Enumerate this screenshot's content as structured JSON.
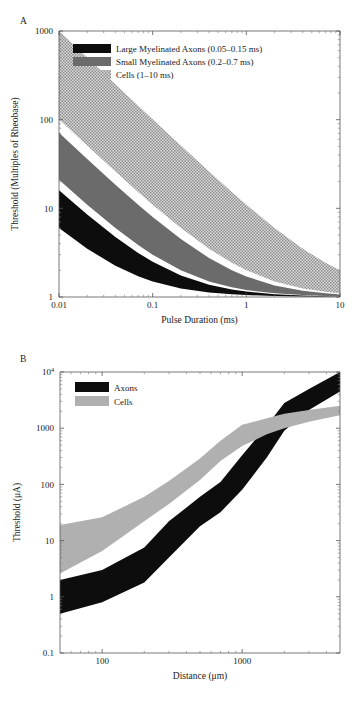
{
  "figure": {
    "panel_a_letter": "A",
    "panel_b_letter": "B"
  },
  "chart_data": [
    {
      "id": "panel-a",
      "type": "area",
      "title": "",
      "xlabel": "Pulse Duration (ms)",
      "ylabel": "Threshold (Multiples of Rheobase)",
      "xscale": "log",
      "yscale": "log",
      "xlim": [
        0.01,
        10
      ],
      "ylim": [
        1,
        1000
      ],
      "xticks": [
        0.01,
        0.1,
        1,
        10
      ],
      "xticklabels": [
        "0.01",
        "0.1",
        "1",
        "10"
      ],
      "yticks": [
        1,
        10,
        100,
        1000
      ],
      "yticklabels": [
        "1",
        "10",
        "100",
        "1000"
      ],
      "grid": false,
      "legend_position": "top-left",
      "series": [
        {
          "name": "Large Myelinated Axons (0.05–0.15 ms)",
          "swatch": "black",
          "color": "#0d0d0d",
          "chronaxie_ms": [
            0.05,
            0.15
          ],
          "x": [
            0.01,
            0.02,
            0.04,
            0.07,
            0.1,
            0.2,
            0.4,
            0.7,
            1.0,
            2.0,
            4.0,
            7.0,
            10.0
          ],
          "upper": [
            16.0,
            8.5,
            4.75,
            3.14,
            2.5,
            1.75,
            1.375,
            1.214,
            1.15,
            1.075,
            1.0375,
            1.0214,
            1.015
          ],
          "lower": [
            6.0,
            3.5,
            2.25,
            1.714,
            1.5,
            1.25,
            1.125,
            1.071,
            1.05,
            1.025,
            1.0125,
            1.007,
            1.005
          ]
        },
        {
          "name": "Small Myelinated Axons (0.2–0.7 ms)",
          "swatch": "gray",
          "color": "#6b6b6b",
          "chronaxie_ms": [
            0.2,
            0.7
          ],
          "x": [
            0.01,
            0.02,
            0.04,
            0.07,
            0.1,
            0.2,
            0.4,
            0.7,
            1.0,
            2.0,
            4.0,
            7.0,
            10.0
          ],
          "upper": [
            71.0,
            36.0,
            18.5,
            11.0,
            8.0,
            4.5,
            2.75,
            2.0,
            1.7,
            1.35,
            1.175,
            1.1,
            1.07
          ],
          "lower": [
            21.0,
            11.0,
            6.0,
            3.857,
            3.0,
            2.0,
            1.5,
            1.286,
            1.2,
            1.1,
            1.05,
            1.029,
            1.02
          ]
        },
        {
          "name": "Cells (1–10 ms)",
          "swatch": "checker",
          "color": "#8f8f8f",
          "chronaxie_ms": [
            1.0,
            10.0
          ],
          "x": [
            0.01,
            0.02,
            0.04,
            0.07,
            0.1,
            0.2,
            0.4,
            0.7,
            1.0,
            2.0,
            4.0,
            7.0,
            10.0
          ],
          "upper": [
            1001.0,
            501.0,
            251.0,
            143.9,
            101.0,
            51.0,
            26.0,
            15.29,
            11.0,
            6.0,
            3.5,
            2.43,
            2.0
          ],
          "lower": [
            101.0,
            51.0,
            26.0,
            15.29,
            11.0,
            6.0,
            3.5,
            2.43,
            2.0,
            1.5,
            1.25,
            1.143,
            1.1
          ]
        }
      ],
      "legend": [
        {
          "label": "Large Myelinated Axons (0.05–0.15 ms)",
          "swatch": "black"
        },
        {
          "label": "Small Myelinated Axons (0.2–0.7 ms)",
          "swatch": "gray"
        },
        {
          "label": "Cells (1–10 ms)",
          "swatch": "checker"
        }
      ]
    },
    {
      "id": "panel-b",
      "type": "area",
      "title": "",
      "xlabel": "Distance (μm)",
      "ylabel": "Threshold (μA)",
      "xscale": "log",
      "yscale": "log",
      "xlim": [
        50,
        5000
      ],
      "ylim": [
        0.1,
        10000
      ],
      "xticks": [
        100,
        1000
      ],
      "xticklabels": [
        "100",
        "1000"
      ],
      "yticks": [
        0.1,
        1,
        10,
        100,
        1000,
        10000
      ],
      "yticklabels": [
        "0.1",
        "1",
        "10",
        "100",
        "1000",
        "10⁴"
      ],
      "grid": false,
      "legend_position": "top-left",
      "series": [
        {
          "name": "Axons",
          "swatch": "black",
          "color": "#0d0d0d",
          "x": [
            50,
            100,
            200,
            300,
            500,
            700,
            1000,
            1500,
            2000,
            3000,
            5000
          ],
          "upper": [
            2.0,
            3.0,
            7.5,
            22.0,
            60.0,
            110.0,
            330.0,
            1100.0,
            2800.0,
            5000.0,
            10000.0
          ],
          "lower": [
            0.5,
            0.8,
            1.8,
            5.0,
            18.0,
            32.0,
            80.0,
            300.0,
            900.0,
            2100.0,
            4500.0
          ]
        },
        {
          "name": "Cells",
          "swatch": "gray",
          "color": "#b0b0b0",
          "x": [
            50,
            100,
            200,
            300,
            500,
            700,
            1000,
            1500,
            2000,
            3000,
            5000
          ],
          "upper": [
            19.0,
            26.0,
            60.0,
            115.0,
            290.0,
            600.0,
            1150.0,
            1500.0,
            1800.0,
            2100.0,
            2500.0
          ],
          "lower": [
            2.6,
            6.5,
            22.0,
            45.0,
            120.0,
            260.0,
            480.0,
            780.0,
            1000.0,
            1300.0,
            1700.0
          ]
        }
      ],
      "legend": [
        {
          "label": "Axons",
          "swatch": "black"
        },
        {
          "label": "Cells",
          "swatch": "gray"
        }
      ]
    }
  ]
}
